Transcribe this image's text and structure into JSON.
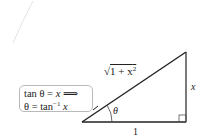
{
  "diagram": {
    "type": "right-triangle",
    "labels": {
      "hypotenuse": "√(1 + x²)",
      "hypotenuse_radicand": "1 + x",
      "hypotenuse_exp": "2",
      "opposite": "x",
      "adjacent": "1",
      "angle": "θ"
    },
    "note": {
      "line1_lhs": "tan θ = ",
      "line1_var": "x",
      "line1_arrow": " ⟹",
      "line2_lhs": "θ = tan",
      "line2_exp": "−1",
      "line2_var": " x"
    },
    "colors": {
      "stroke": "#222222",
      "box_border": "#b9b9b9",
      "faint_curve": "#e3e3e3"
    }
  }
}
